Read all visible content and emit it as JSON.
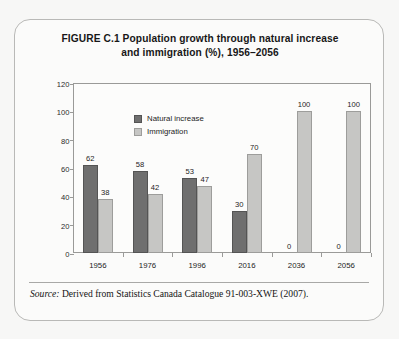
{
  "figure": {
    "title_line1": "FIGURE C.1  Population growth through natural increase",
    "title_line2": "and immigration (%), 1956–2056",
    "source_label": "Source:",
    "source_text": " Derived from Statistics Canada Catalogue 91-003-XWE (2007)."
  },
  "colors": {
    "natural_increase": "#6f6f6f",
    "immigration": "#c6c6c4",
    "axis": "#9a9a98",
    "text": "#1d1d1d",
    "box_border": "#b9b9b7",
    "page_background": "#f7f7f6"
  },
  "chart_data": {
    "type": "bar",
    "title": "FIGURE C.1  Population growth through natural increase and immigration (%), 1956–2056",
    "xlabel": "",
    "ylabel": "",
    "ylim": [
      0,
      120
    ],
    "yticks": [
      0,
      20,
      40,
      60,
      80,
      100,
      120
    ],
    "ytick_labels": [
      "0",
      "20",
      "40",
      "60",
      "80",
      "100",
      "120"
    ],
    "grid": false,
    "legend_position": "inside-top-left",
    "categories": [
      "1956",
      "1976",
      "1996",
      "2016",
      "2036",
      "2056"
    ],
    "series": [
      {
        "name": "Natural increase",
        "color": "#6f6f6f",
        "values": [
          62,
          58,
          53,
          30,
          0,
          0
        ],
        "value_labels": [
          "62",
          "58",
          "53",
          "30",
          "0",
          "0"
        ]
      },
      {
        "name": "Immigration",
        "color": "#c6c6c4",
        "values": [
          38,
          42,
          47,
          70,
          100,
          100
        ],
        "value_labels": [
          "38",
          "42",
          "47",
          "70",
          "100",
          "100"
        ]
      }
    ]
  }
}
